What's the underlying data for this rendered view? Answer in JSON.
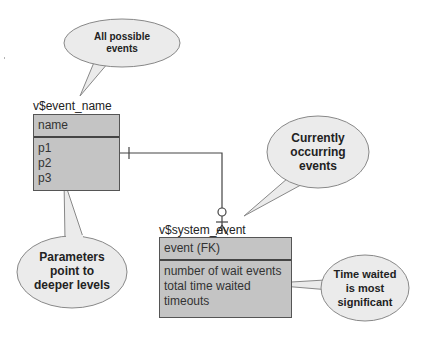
{
  "diagram": {
    "entities": [
      {
        "title": "v$event_name",
        "header": "name",
        "fields": [
          "p1",
          "p2",
          "p3"
        ]
      },
      {
        "title": "v$system_event",
        "header": "event (FK)",
        "fields": [
          "number of wait events",
          "total time waited",
          "timeouts"
        ]
      }
    ],
    "callouts": [
      {
        "id": "all-possible",
        "lines": [
          "All possible",
          "events"
        ]
      },
      {
        "id": "currently-occurring",
        "lines": [
          "Currently",
          "occurring",
          "events"
        ]
      },
      {
        "id": "parameters",
        "lines": [
          "Parameters",
          "point to",
          "deeper levels"
        ]
      },
      {
        "id": "time-waited",
        "lines": [
          "Time waited",
          "is most",
          "significant"
        ]
      }
    ],
    "relationship": {
      "from": "v$event_name",
      "to": "v$system_event",
      "cardinality": "one-to-zero-or-many"
    },
    "colors": {
      "entity_fill": "#c4c4c4",
      "bubble_fill": "#ebebeb",
      "line": "#444444"
    }
  }
}
